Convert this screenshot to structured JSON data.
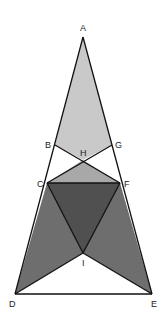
{
  "diagram": {
    "type": "geometry-figure",
    "points": {
      "A": [
        83,
        37
      ],
      "B": [
        55,
        145
      ],
      "G": [
        112,
        145
      ],
      "H": [
        83,
        160
      ],
      "C": [
        47,
        183
      ],
      "F": [
        120,
        183
      ],
      "I": [
        83,
        253
      ],
      "D": [
        15,
        294
      ],
      "E": [
        152,
        294
      ]
    },
    "labels": [
      {
        "id": "A",
        "text": "A",
        "x": 80,
        "y": 31
      },
      {
        "id": "B",
        "text": "B",
        "x": 45,
        "y": 148
      },
      {
        "id": "G",
        "text": "G",
        "x": 115,
        "y": 148
      },
      {
        "id": "H",
        "text": "H",
        "x": 80,
        "y": 156
      },
      {
        "id": "C",
        "text": "C",
        "x": 37,
        "y": 187
      },
      {
        "id": "F",
        "text": "F",
        "x": 124,
        "y": 187
      },
      {
        "id": "I",
        "text": "I",
        "x": 82,
        "y": 266
      },
      {
        "id": "D",
        "text": "D",
        "x": 9,
        "y": 307
      },
      {
        "id": "E",
        "text": "E",
        "x": 151,
        "y": 307
      }
    ],
    "fills": {
      "light": "#c9c9c9",
      "medium": "#a8a8a8",
      "dark": "#6e6e6e",
      "darker": "#505050",
      "white": "#ffffff",
      "stroke": "#111111"
    }
  }
}
